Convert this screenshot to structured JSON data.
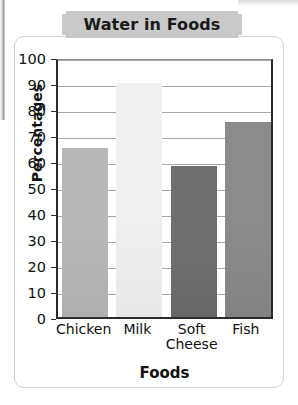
{
  "figure": {
    "title": "Water in Foods",
    "banner_color": "#c9c9c9",
    "card_background": "#ffffff"
  },
  "chart_data": {
    "type": "bar",
    "title": "Water in Foods",
    "xlabel": "Foods",
    "ylabel": "Percentages",
    "categories": [
      "Chicken",
      "Milk",
      "Soft Cheese",
      "Fish"
    ],
    "category_lines": [
      [
        "Chicken"
      ],
      [
        "Milk"
      ],
      [
        "Soft",
        "Cheese"
      ],
      [
        "Fish"
      ]
    ],
    "values": [
      65,
      90,
      58,
      75
    ],
    "ylim": [
      0,
      100
    ],
    "yticks": [
      0,
      10,
      20,
      30,
      40,
      50,
      60,
      70,
      80,
      90,
      100
    ],
    "ytick_labels": [
      "0",
      "10",
      "20",
      "30",
      "40",
      "50",
      "60",
      "70",
      "80",
      "90",
      "100"
    ],
    "grid": true,
    "legend": false,
    "bar_colors": [
      "#b7b7b7",
      "#f0f0f0",
      "#6f6f6f",
      "#8b8b8b"
    ]
  }
}
